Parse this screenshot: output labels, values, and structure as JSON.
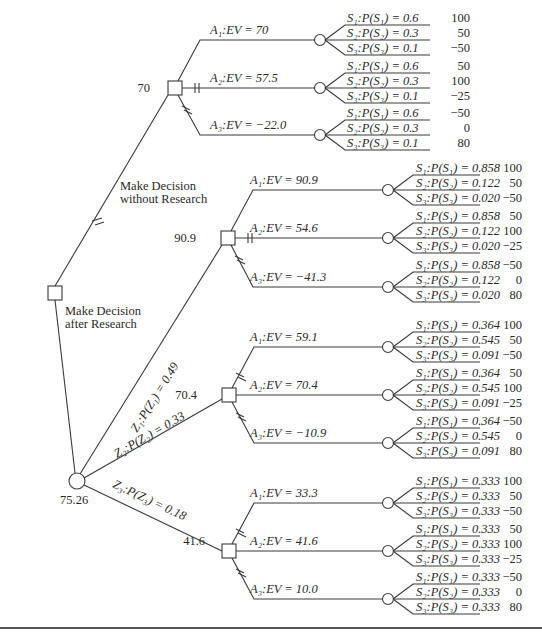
{
  "diagram": {
    "type": "decision-tree",
    "root": {
      "node_type": "decision",
      "branches": [
        {
          "label_line1": "Make Decision",
          "label_line2": "without Research",
          "ev": "70",
          "alternatives": [
            {
              "label": "A₁:EV = 70",
              "states": [
                {
                  "label": "S₁:P(S₁) = 0.6",
                  "payoff": "100"
                },
                {
                  "label": "S₂:P(S₂) = 0.3",
                  "payoff": "50"
                },
                {
                  "label": "S₃:P(S₃) = 0.1",
                  "payoff": "−50"
                }
              ]
            },
            {
              "label": "A₂:EV = 57.5",
              "states": [
                {
                  "label": "S₁:P(S₁) = 0.6",
                  "payoff": "50"
                },
                {
                  "label": "S₂:P(S₂) = 0.3",
                  "payoff": "100"
                },
                {
                  "label": "S₃:P(S₃) = 0.1",
                  "payoff": "−25"
                }
              ]
            },
            {
              "label": "A₃:EV = −22.0",
              "states": [
                {
                  "label": "S₁:P(S₁) = 0.6",
                  "payoff": "−50"
                },
                {
                  "label": "S₂:P(S₂) = 0.3",
                  "payoff": "0"
                },
                {
                  "label": "S₃:P(S₃) = 0.1",
                  "payoff": "80"
                }
              ]
            }
          ]
        },
        {
          "label_line1": "Make Decision",
          "label_line2": "after Research",
          "ev": "75.26",
          "outcomes": [
            {
              "label": "Z₁:P(Z₁) = 0.49",
              "ev": "90.9",
              "alternatives": [
                {
                  "label": "A₁:EV = 90.9",
                  "states": [
                    {
                      "label": "S₁:P(S₁) = 0.858",
                      "payoff": "100"
                    },
                    {
                      "label": "S₂:P(S₂) = 0.122",
                      "payoff": "50"
                    },
                    {
                      "label": "S₃:P(S₃) = 0.020",
                      "payoff": "−50"
                    }
                  ]
                },
                {
                  "label": "A₂:EV = 54.6",
                  "states": [
                    {
                      "label": "S₁:P(S₁) = 0.858",
                      "payoff": "50"
                    },
                    {
                      "label": "S₂:P(S₂) = 0.122",
                      "payoff": "100"
                    },
                    {
                      "label": "S₃:P(S₃) = 0.020",
                      "payoff": "−25"
                    }
                  ]
                },
                {
                  "label": "A₃:EV = −41.3",
                  "states": [
                    {
                      "label": "S₁:P(S₁) = 0.858",
                      "payoff": "−50"
                    },
                    {
                      "label": "S₂:P(S₂) = 0.122",
                      "payoff": "0"
                    },
                    {
                      "label": "S₃:P(S₃) = 0.020",
                      "payoff": "80"
                    }
                  ]
                }
              ]
            },
            {
              "label": "Z₂:P(Z₂) = 0.33",
              "ev": "70.4",
              "alternatives": [
                {
                  "label": "A₁:EV = 59.1",
                  "states": [
                    {
                      "label": "S₁:P(S₁) = 0.364",
                      "payoff": "100"
                    },
                    {
                      "label": "S₂:P(S₂) = 0.545",
                      "payoff": "50"
                    },
                    {
                      "label": "S₃:P(S₃) = 0.091",
                      "payoff": "−50"
                    }
                  ]
                },
                {
                  "label": "A₂:EV = 70.4",
                  "states": [
                    {
                      "label": "S₁:P(S₁) = 0.364",
                      "payoff": "50"
                    },
                    {
                      "label": "S₂:P(S₂) = 0.545",
                      "payoff": "100"
                    },
                    {
                      "label": "S₃:P(S₃) = 0.091",
                      "payoff": "−25"
                    }
                  ]
                },
                {
                  "label": "A₃:EV = −10.9",
                  "states": [
                    {
                      "label": "S₁:P(S₁) = 0.364",
                      "payoff": "−50"
                    },
                    {
                      "label": "S₂:P(S₂) = 0.545",
                      "payoff": "0"
                    },
                    {
                      "label": "S₃:P(S₃) = 0.091",
                      "payoff": "80"
                    }
                  ]
                }
              ]
            },
            {
              "label": "Z₃:P(Z₃) = 0.18",
              "ev": "41.6",
              "alternatives": [
                {
                  "label": "A₁:EV = 33.3",
                  "states": [
                    {
                      "label": "S₁:P(S₁) = 0.333",
                      "payoff": "100"
                    },
                    {
                      "label": "S₂:P(S₂) = 0.333",
                      "payoff": "50"
                    },
                    {
                      "label": "S₃:P(S₃) = 0.333",
                      "payoff": "−50"
                    }
                  ]
                },
                {
                  "label": "A₂:EV = 41.6",
                  "states": [
                    {
                      "label": "S₁:P(S₁) = 0.333",
                      "payoff": "50"
                    },
                    {
                      "label": "S₂:P(S₂) = 0.333",
                      "payoff": "100"
                    },
                    {
                      "label": "S₃:P(S₃) = 0.333",
                      "payoff": "−25"
                    }
                  ]
                },
                {
                  "label": "A₃:EV = 10.0",
                  "states": [
                    {
                      "label": "S₁:P(S₁) = 0.333",
                      "payoff": "−50"
                    },
                    {
                      "label": "S₂:P(S₂) = 0.333",
                      "payoff": "0"
                    },
                    {
                      "label": "S₃:P(S₃) = 0.333",
                      "payoff": "80"
                    }
                  ]
                }
              ]
            }
          ]
        }
      ]
    },
    "colors": {
      "line": "#3a3a3a",
      "text": "#2a2a2a",
      "background": "#ffffff"
    }
  }
}
